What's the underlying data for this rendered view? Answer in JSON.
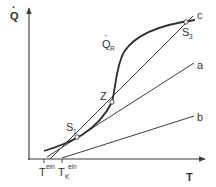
{
  "diagram": {
    "type": "heat-balance-diagram",
    "colors": {
      "line": "#3a3a3a",
      "text": "#333333",
      "background": "#ffffff"
    },
    "axes": {
      "y_label": "Q",
      "y_label_dot": "·",
      "x_label": "T"
    },
    "x_ticks": [
      {
        "id": "T_ein",
        "base": "T",
        "sup": "ein",
        "sub": ""
      },
      {
        "id": "T_K_ein",
        "base": "T",
        "sup": "ein",
        "sub": "K"
      }
    ],
    "curves": [
      {
        "id": "Q_R",
        "label_base": "Q",
        "label_sub": "R",
        "kind": "S-shaped heat generation curve"
      },
      {
        "id": "a",
        "label": "a",
        "kind": "heat removal line"
      },
      {
        "id": "b",
        "label": "b",
        "kind": "heat removal line"
      },
      {
        "id": "c",
        "label": "c",
        "kind": "heat removal line"
      }
    ],
    "points": [
      {
        "id": "S1",
        "base": "S",
        "sub": "1"
      },
      {
        "id": "Z",
        "base": "Z",
        "sub": ""
      },
      {
        "id": "S3",
        "base": "S",
        "sub": "3"
      }
    ]
  }
}
